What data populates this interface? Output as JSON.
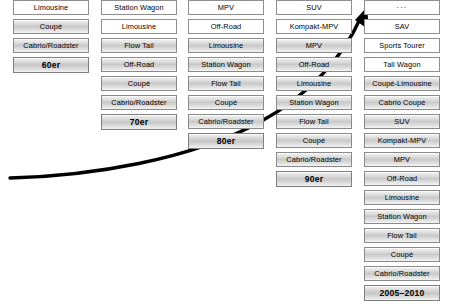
{
  "diagram": {
    "arrow": {
      "name": "growth-arrow",
      "description": "upward curving exponential growth arrow",
      "color": "#000000"
    },
    "colors": {
      "new_box_fill": "#ffffff",
      "established_box_fill": "#d0d0d0",
      "box_border": "#8a8a8a",
      "text": "#000000",
      "arrow": "#000000"
    },
    "legend_semantics": {
      "new": "white box - body style newly introduced in this period",
      "established": "shaded box - body style carried over from earlier period"
    },
    "columns": [
      {
        "id": "col-60er",
        "decade_label": "60er",
        "items": [
          {
            "label": "Limousine",
            "state": "new"
          },
          {
            "label": "Coupé",
            "state": "established"
          },
          {
            "label": "Cabrio/Roadster",
            "state": "established"
          }
        ]
      },
      {
        "id": "col-70er",
        "decade_label": "70er",
        "items": [
          {
            "label": "Station Wagon",
            "state": "new"
          },
          {
            "label": "Limousine",
            "state": "new"
          },
          {
            "label": "Flow Tail",
            "state": "established"
          },
          {
            "label": "Off-Road",
            "state": "established"
          },
          {
            "label": "Coupé",
            "state": "established"
          },
          {
            "label": "Cabrio/Roadster",
            "state": "established"
          }
        ]
      },
      {
        "id": "col-80er",
        "decade_label": "80er",
        "items": [
          {
            "label": "MPV",
            "state": "new"
          },
          {
            "label": "Off-Road",
            "state": "new"
          },
          {
            "label": "Limousine",
            "state": "established"
          },
          {
            "label": "Station Wagon",
            "state": "established"
          },
          {
            "label": "Flow Tail",
            "state": "established"
          },
          {
            "label": "Coupé",
            "state": "established"
          },
          {
            "label": "Cabrio/Roadster",
            "state": "established"
          }
        ]
      },
      {
        "id": "col-90er",
        "decade_label": "90er",
        "items": [
          {
            "label": "SUV",
            "state": "new"
          },
          {
            "label": "Kompakt-MPV",
            "state": "new"
          },
          {
            "label": "MPV",
            "state": "established"
          },
          {
            "label": "Off-Road",
            "state": "established"
          },
          {
            "label": "Limousine",
            "state": "established"
          },
          {
            "label": "Station Wagon",
            "state": "established"
          },
          {
            "label": "Flow Tail",
            "state": "established"
          },
          {
            "label": "Coupé",
            "state": "established"
          },
          {
            "label": "Cabrio/Roadster",
            "state": "established"
          }
        ]
      },
      {
        "id": "col-2005-2010",
        "decade_label": "2005–2010",
        "items": [
          {
            "label": "...",
            "state": "new",
            "variant": "ellipsis"
          },
          {
            "label": "SAV",
            "state": "new"
          },
          {
            "label": "Sports Tourer",
            "state": "new"
          },
          {
            "label": "Tall Wagon",
            "state": "new"
          },
          {
            "label": "Coupé-Limousine",
            "state": "established"
          },
          {
            "label": "Cabrio Coupé",
            "state": "established"
          },
          {
            "label": "SUV",
            "state": "established"
          },
          {
            "label": "Kompakt-MPV",
            "state": "established"
          },
          {
            "label": "MPV",
            "state": "established"
          },
          {
            "label": "Off-Road",
            "state": "established"
          },
          {
            "label": "Limousine",
            "state": "established"
          },
          {
            "label": "Station Wagon",
            "state": "established"
          },
          {
            "label": "Flow Tail",
            "state": "established"
          },
          {
            "label": "Coupé",
            "state": "established"
          },
          {
            "label": "Cabrio/Roadster",
            "state": "established"
          }
        ]
      }
    ]
  }
}
